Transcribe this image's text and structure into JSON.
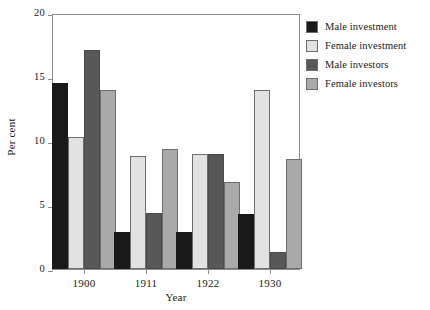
{
  "chart_data": {
    "type": "bar",
    "title": "",
    "xlabel": "Year",
    "ylabel": "Per cent",
    "categories": [
      "1900",
      "1911",
      "1922",
      "1930"
    ],
    "ylim": [
      0,
      20
    ],
    "yticks": [
      0,
      5,
      10,
      15,
      20
    ],
    "ytick_labels": [
      "0",
      "5",
      "10",
      "15",
      "20"
    ],
    "grid": false,
    "legend_position": "right",
    "series": [
      {
        "name": "Male investment",
        "color": "#191919",
        "values": [
          14.5,
          2.9,
          2.9,
          4.3
        ]
      },
      {
        "name": "Female investment",
        "color": "#e2e2e2",
        "values": [
          10.3,
          8.8,
          9.0,
          14.0
        ]
      },
      {
        "name": "Male investors",
        "color": "#585858",
        "values": [
          17.1,
          4.4,
          9.0,
          1.3
        ]
      },
      {
        "name": "Female investors",
        "color": "#a9a9a9",
        "values": [
          14.0,
          9.4,
          6.8,
          8.6
        ]
      }
    ]
  }
}
